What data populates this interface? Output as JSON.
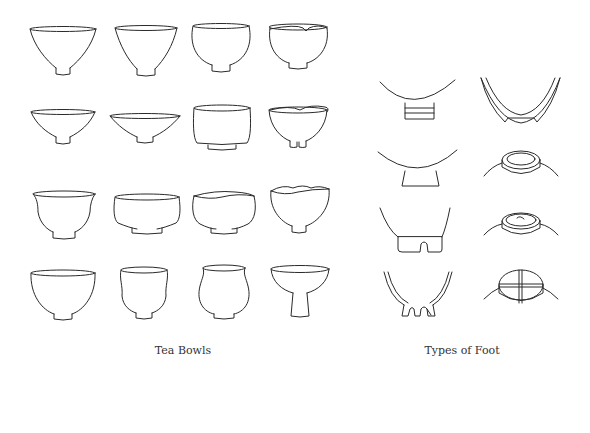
{
  "figure": {
    "panels": [
      {
        "id": "tea-bowls",
        "caption": "Tea Bowls",
        "grid": {
          "rows": 4,
          "cols": 4
        },
        "items": [
          {
            "row": 1,
            "col": 1,
            "shape": "wide conical bowl with small foot"
          },
          {
            "row": 1,
            "col": 2,
            "shape": "deep conical bowl with small foot"
          },
          {
            "row": 1,
            "col": 3,
            "shape": "rounded deep bowl with foot"
          },
          {
            "row": 1,
            "col": 4,
            "shape": "straight-sided bowl with notched rim"
          },
          {
            "row": 2,
            "col": 1,
            "shape": "shallow conical bowl"
          },
          {
            "row": 2,
            "col": 2,
            "shape": "very shallow flared bowl"
          },
          {
            "row": 2,
            "col": 3,
            "shape": "cylindrical bowl"
          },
          {
            "row": 2,
            "col": 4,
            "shape": "irregular rim bowl with split foot"
          },
          {
            "row": 3,
            "col": 1,
            "shape": "flared-lip round bowl"
          },
          {
            "row": 3,
            "col": 2,
            "shape": "wide low cylindrical bowl"
          },
          {
            "row": 3,
            "col": 3,
            "shape": "low bowl with wavy rim"
          },
          {
            "row": 3,
            "col": 4,
            "shape": "deep bowl with wavy rim"
          },
          {
            "row": 4,
            "col": 1,
            "shape": "deep round bowl"
          },
          {
            "row": 4,
            "col": 2,
            "shape": "tall waisted bowl"
          },
          {
            "row": 4,
            "col": 3,
            "shape": "globular bowl with inturned rim"
          },
          {
            "row": 4,
            "col": 4,
            "shape": "stem cup on tall foot"
          }
        ]
      },
      {
        "id": "types-of-foot",
        "caption": "Types of Foot",
        "grid": {
          "rows": 4,
          "cols": 2
        },
        "items": [
          {
            "row": 1,
            "col": 1,
            "shape": "banded ring foot"
          },
          {
            "row": 1,
            "col": 2,
            "shape": "cut-out high foot (section)"
          },
          {
            "row": 2,
            "col": 1,
            "shape": "flared tall foot"
          },
          {
            "row": 2,
            "col": 2,
            "shape": "ring foot seen from below"
          },
          {
            "row": 3,
            "col": 1,
            "shape": "notched foot"
          },
          {
            "row": 3,
            "col": 2,
            "shape": "ring foot with center nipple"
          },
          {
            "row": 4,
            "col": 1,
            "shape": "split multi-notched foot (section)"
          },
          {
            "row": 4,
            "col": 2,
            "shape": "cross-cut foot"
          }
        ]
      }
    ],
    "colors": {
      "line": "#2a2a2a",
      "caption": "#333333",
      "background": "#ffffff"
    }
  }
}
